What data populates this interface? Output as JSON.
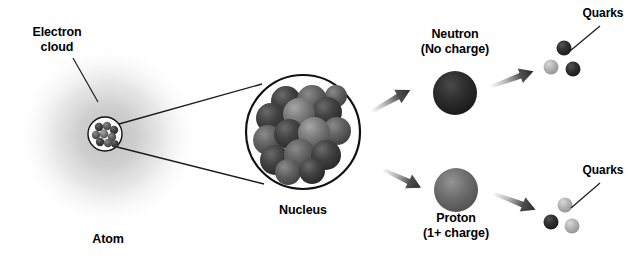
{
  "diagram": {
    "background_color": "#ffffff",
    "width": 638,
    "height": 263
  },
  "labels": {
    "electron_cloud_line1": "Electron",
    "electron_cloud_line2": "cloud",
    "atom": "Atom",
    "nucleus": "Nucleus",
    "neutron_line1": "Neutron",
    "neutron_line2": "(No charge)",
    "proton_line1": "Proton",
    "proton_line2": "(1+ charge)",
    "quarks_neutron": "Quarks",
    "quarks_proton": "Quarks"
  },
  "colors": {
    "text": "#000000",
    "outline": "#111111",
    "electron_cloud": "#c9c9c9",
    "nucleon_dark": "#3a3a3a",
    "nucleon_mid": "#5e5e5e",
    "nucleon_light": "#7d7d7d",
    "neutron_sphere": "#262626",
    "proton_sphere": "#6b6b6b",
    "quark_dark": "#2b2b2b",
    "quark_light": "#b4b4b4",
    "arrow": "#3d3d3d"
  },
  "atom": {
    "electron_cloud": {
      "cx": 108,
      "cy": 136,
      "r": 92
    },
    "nucleus_circle": {
      "cx": 105,
      "cy": 134,
      "r": 17
    },
    "nucleons": [
      {
        "cx": 99,
        "cy": 127,
        "r": 4.2,
        "shade": "dark"
      },
      {
        "cx": 107,
        "cy": 126,
        "r": 4.2,
        "shade": "mid"
      },
      {
        "cx": 114,
        "cy": 130,
        "r": 4.2,
        "shade": "dark"
      },
      {
        "cx": 96,
        "cy": 135,
        "r": 4.2,
        "shade": "mid"
      },
      {
        "cx": 104,
        "cy": 134,
        "r": 4.4,
        "shade": "light"
      },
      {
        "cx": 112,
        "cy": 137,
        "r": 4.2,
        "shade": "mid"
      },
      {
        "cx": 100,
        "cy": 142,
        "r": 4.2,
        "shade": "dark"
      },
      {
        "cx": 108,
        "cy": 143,
        "r": 4.2,
        "shade": "mid"
      },
      {
        "cx": 115,
        "cy": 144,
        "r": 3.8,
        "shade": "dark"
      }
    ]
  },
  "nucleus_zoom": {
    "circle": {
      "cx": 303,
      "cy": 132,
      "r": 57
    },
    "nucleons": [
      {
        "cx": 286,
        "cy": 101,
        "r": 15,
        "shade": "dark"
      },
      {
        "cx": 312,
        "cy": 100,
        "r": 15,
        "shade": "mid"
      },
      {
        "cx": 271,
        "cy": 118,
        "r": 15,
        "shade": "dark"
      },
      {
        "cx": 299,
        "cy": 114,
        "r": 16,
        "shade": "light"
      },
      {
        "cx": 327,
        "cy": 112,
        "r": 15,
        "shade": "dark"
      },
      {
        "cx": 337,
        "cy": 131,
        "r": 14,
        "shade": "mid"
      },
      {
        "cx": 268,
        "cy": 140,
        "r": 15,
        "shade": "mid"
      },
      {
        "cx": 289,
        "cy": 134,
        "r": 15,
        "shade": "dark"
      },
      {
        "cx": 314,
        "cy": 133,
        "r": 16,
        "shade": "light"
      },
      {
        "cx": 275,
        "cy": 160,
        "r": 15,
        "shade": "dark"
      },
      {
        "cx": 300,
        "cy": 155,
        "r": 16,
        "shade": "mid"
      },
      {
        "cx": 326,
        "cy": 155,
        "r": 15,
        "shade": "dark"
      },
      {
        "cx": 288,
        "cy": 172,
        "r": 13,
        "shade": "mid"
      },
      {
        "cx": 312,
        "cy": 171,
        "r": 13,
        "shade": "dark"
      },
      {
        "cx": 336,
        "cy": 96,
        "r": 11,
        "shade": "mid"
      }
    ]
  },
  "particles": {
    "neutron": {
      "cx": 455,
      "cy": 93,
      "r": 22,
      "charge": "no charge"
    },
    "proton": {
      "cx": 456,
      "cy": 190,
      "r": 22,
      "charge": "1+ charge"
    }
  },
  "quarks": {
    "neutron_set": [
      {
        "cx": 564,
        "cy": 48,
        "r": 7.5,
        "shade": "dark"
      },
      {
        "cx": 551,
        "cy": 67,
        "r": 7.5,
        "shade": "light"
      },
      {
        "cx": 573,
        "cy": 69,
        "r": 7.5,
        "shade": "dark"
      }
    ],
    "proton_set": [
      {
        "cx": 565,
        "cy": 205,
        "r": 7.5,
        "shade": "light"
      },
      {
        "cx": 551,
        "cy": 222,
        "r": 7.5,
        "shade": "dark"
      },
      {
        "cx": 572,
        "cy": 226,
        "r": 7.5,
        "shade": "light"
      }
    ]
  },
  "arrows": [
    {
      "name": "arrow-nucleus-to-neutron",
      "x1": 370,
      "y1": 108,
      "x2": 414,
      "y2": 84
    },
    {
      "name": "arrow-nucleus-to-proton",
      "x1": 385,
      "y1": 166,
      "x2": 424,
      "y2": 186
    },
    {
      "name": "arrow-neutron-to-quarks",
      "x1": 490,
      "y1": 83,
      "x2": 534,
      "y2": 68
    },
    {
      "name": "arrow-proton-to-quarks",
      "x1": 495,
      "y1": 190,
      "x2": 538,
      "y2": 208
    }
  ],
  "leaders": [
    {
      "name": "leader-electron-cloud",
      "x1": 73,
      "y1": 58,
      "x2": 98,
      "y2": 102
    },
    {
      "name": "leader-quarks-neutron",
      "x1": 600,
      "y1": 26,
      "x2": 570,
      "y2": 51
    },
    {
      "name": "leader-quarks-proton",
      "x1": 600,
      "y1": 183,
      "x2": 571,
      "y2": 208
    }
  ],
  "zoom_lines": [
    {
      "name": "zoom-line-top",
      "x1": 119,
      "y1": 124,
      "x2": 262,
      "y2": 84
    },
    {
      "name": "zoom-line-bottom",
      "x1": 117,
      "y1": 147,
      "x2": 264,
      "y2": 184
    }
  ]
}
